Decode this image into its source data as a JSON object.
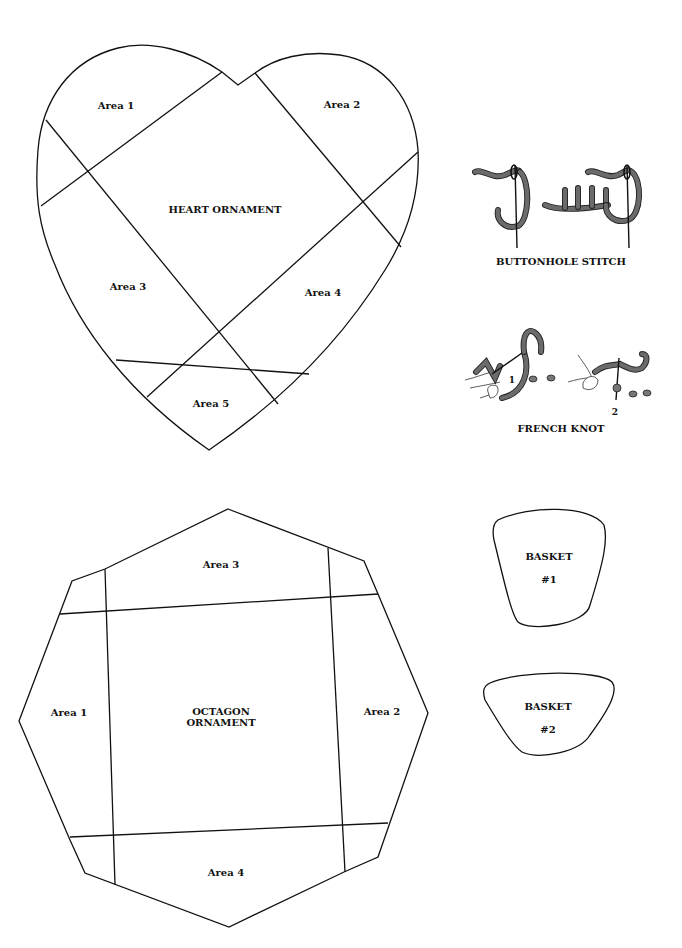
{
  "heart": {
    "title": "HEART ORNAMENT",
    "areas": [
      "Area 1",
      "Area 2",
      "Area 3",
      "Area 4",
      "Area 5"
    ]
  },
  "octagon": {
    "title_line1": "OCTAGON",
    "title_line2": "ORNAMENT",
    "areas": [
      "Area 1",
      "Area 2",
      "Area 3",
      "Area 4"
    ]
  },
  "stitches": {
    "buttonhole": "BUTTONHOLE STITCH",
    "french_knot": "FRENCH KNOT",
    "step1": "1",
    "step2": "2"
  },
  "baskets": [
    {
      "label": "BASKET",
      "number": "#1"
    },
    {
      "label": "BASKET",
      "number": "#2"
    }
  ],
  "colors": {
    "line": "#111111",
    "thread": "#6b6b6b",
    "background": "#ffffff"
  }
}
